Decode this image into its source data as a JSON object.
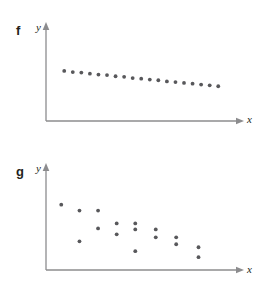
{
  "page": {
    "background_color": "#ffffff",
    "width": 263,
    "height": 282
  },
  "style": {
    "dot_color": "#58585b",
    "axis_color": "#8c8c8e",
    "text_color": "#231f20",
    "dot_radius": 1.9
  },
  "panels": [
    {
      "id": "f",
      "panel_label": "f",
      "y_axis_label": "y",
      "x_axis_label": "x"
    },
    {
      "id": "g",
      "panel_label": "g",
      "y_axis_label": "y",
      "x_axis_label": "x"
    }
  ],
  "chart_data": [
    {
      "type": "scatter",
      "title": "f",
      "xlabel": "x",
      "ylabel": "y",
      "grid": false,
      "legend": "none",
      "axis_style": "arrow-headed x and y axes, no tick marks, no tick labels",
      "description": "Strong negative linear association: points lie very close to a straight descending line.",
      "xlim": [
        0,
        100
      ],
      "ylim": [
        0,
        100
      ],
      "points": [
        {
          "x": 9.8,
          "y": 55.0
        },
        {
          "x": 14.4,
          "y": 53.8
        },
        {
          "x": 19.0,
          "y": 53.2
        },
        {
          "x": 23.6,
          "y": 52.0
        },
        {
          "x": 28.2,
          "y": 51.0
        },
        {
          "x": 32.8,
          "y": 50.5
        },
        {
          "x": 37.4,
          "y": 49.2
        },
        {
          "x": 42.0,
          "y": 48.5
        },
        {
          "x": 46.6,
          "y": 47.2
        },
        {
          "x": 51.2,
          "y": 46.5
        },
        {
          "x": 55.8,
          "y": 45.5
        },
        {
          "x": 60.4,
          "y": 44.8
        },
        {
          "x": 65.0,
          "y": 43.5
        },
        {
          "x": 69.6,
          "y": 42.8
        },
        {
          "x": 74.2,
          "y": 41.8
        },
        {
          "x": 78.8,
          "y": 41.0
        },
        {
          "x": 83.4,
          "y": 40.0
        },
        {
          "x": 88.0,
          "y": 39.2
        },
        {
          "x": 92.6,
          "y": 38.2
        }
      ]
    },
    {
      "type": "scatter",
      "title": "g",
      "xlabel": "x",
      "ylabel": "y",
      "grid": false,
      "legend": "none",
      "axis_style": "arrow-headed x and y axes, no tick marks, no tick labels",
      "description": "Weak to moderate negative association: points trend downward but are widely scattered.",
      "xlim": [
        0,
        100
      ],
      "ylim": [
        0,
        100
      ],
      "points": [
        {
          "x": 8.2,
          "y": 66.0
        },
        {
          "x": 18.0,
          "y": 60.0
        },
        {
          "x": 28.0,
          "y": 60.0
        },
        {
          "x": 28.0,
          "y": 42.0
        },
        {
          "x": 18.0,
          "y": 29.0
        },
        {
          "x": 38.0,
          "y": 47.0
        },
        {
          "x": 38.0,
          "y": 36.0
        },
        {
          "x": 48.0,
          "y": 47.0
        },
        {
          "x": 48.0,
          "y": 41.0
        },
        {
          "x": 48.0,
          "y": 19.0
        },
        {
          "x": 59.0,
          "y": 41.0
        },
        {
          "x": 59.0,
          "y": 33.0
        },
        {
          "x": 70.0,
          "y": 33.0
        },
        {
          "x": 70.0,
          "y": 26.0
        },
        {
          "x": 82.0,
          "y": 23.0
        },
        {
          "x": 82.0,
          "y": 13.0
        }
      ]
    }
  ]
}
